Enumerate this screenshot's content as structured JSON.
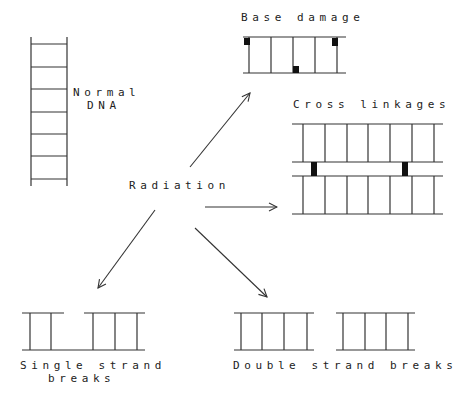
{
  "diagram": {
    "center_label": "Radiation",
    "colors": {
      "line": "#333333",
      "block": "#111111",
      "text": "#222222",
      "background": "#ffffff"
    },
    "nodes": {
      "normal": {
        "line1": "Normal",
        "line2": "DNA"
      },
      "base_damage": {
        "label": "Base damage"
      },
      "cross_linkages": {
        "label": "Cross linkages"
      },
      "single_strand": {
        "line1": "Single strand",
        "line2": "breaks"
      },
      "double_strand": {
        "label": "Double strand breaks"
      }
    },
    "edges": [
      {
        "from": "Radiation",
        "to": "Base damage"
      },
      {
        "from": "Radiation",
        "to": "Cross linkages"
      },
      {
        "from": "Radiation",
        "to": "Single strand breaks"
      },
      {
        "from": "Radiation",
        "to": "Double strand breaks"
      }
    ]
  }
}
